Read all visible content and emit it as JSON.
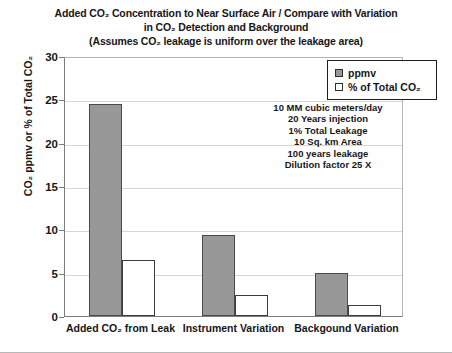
{
  "chart_data": {
    "type": "bar",
    "title_lines": [
      "Added CO₂ Concentration to Near Surface Air / Compare with Variation",
      "in CO₂ Detection and Background",
      "(Assumes CO₂ leakage is uniform over the leakage area)"
    ],
    "categories": [
      "Added CO₂ from Leak",
      "Instrument Variation",
      "Backgound Variation"
    ],
    "series": [
      {
        "name": "ppmv",
        "values": [
          24.5,
          9.4,
          5.0
        ],
        "color": "#989898"
      },
      {
        "name": "% of Total CO₂",
        "values": [
          6.5,
          2.4,
          1.3
        ],
        "color": "#ffffff"
      }
    ],
    "xlabel": "",
    "ylabel": "CO₂ ppmv or % of Total CO₂",
    "ylim": [
      0,
      30
    ],
    "yticks": [
      0,
      5,
      10,
      15,
      20,
      25,
      30
    ],
    "ytick_labels": [
      "0",
      "5",
      "10",
      "15",
      "20",
      "25",
      "30"
    ],
    "grid": true,
    "legend_position": "top-right",
    "annotations": [
      "10 MM cubic meters/day",
      "20 Years injection",
      "1% Total Leakage",
      "10 Sq. km Area",
      "100 years leakage",
      "Dilution factor 25 X"
    ]
  },
  "legend": {
    "items": [
      {
        "label": "ppmv",
        "swatch": "filled-gray-square"
      },
      {
        "label": "% of Total CO₂",
        "swatch": "empty-white-square"
      }
    ]
  }
}
